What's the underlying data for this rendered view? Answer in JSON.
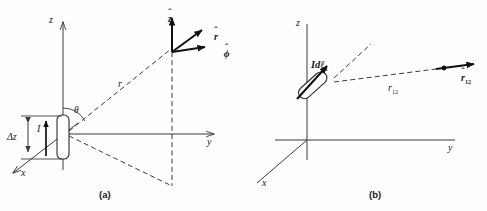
{
  "figure": {
    "background_color": "#fefefe",
    "line_color": "#3b3b3b",
    "bold_line_color": "#111111",
    "text_color": "#1a1a1a",
    "width": 487,
    "height": 211
  },
  "panel_a": {
    "caption": "(a)",
    "axes": {
      "z_label": "z",
      "y_label": "y",
      "x_label": "x"
    },
    "labels": {
      "angle_theta": "θ",
      "radial_distance": "r",
      "current": "I",
      "delta_z": "Δz",
      "unit_z": "z",
      "unit_z_hat": "ˆ",
      "unit_r": "r",
      "unit_r_hat": "ˆ",
      "unit_phi": "ϕ",
      "unit_phi_hat": "ˆ"
    },
    "elements": {
      "dipole_element": "dipole-rod",
      "current_arrow": "current-direction-arrow",
      "delta_z_dimension": "delta-z-dimension",
      "field_point": "field-point",
      "projection": "dashed-projection-triangle"
    }
  },
  "panel_b": {
    "caption": "(b)",
    "axes": {
      "z_label": "z",
      "y_label": "y",
      "x_label": "x"
    },
    "labels": {
      "current_element": "Idℓ",
      "current_element_sub": "1",
      "separation": "r",
      "separation_sub": "12",
      "unit_vector": "r",
      "unit_vector_hat": "ˆ",
      "unit_vector_sub": "12"
    },
    "elements": {
      "current_element_rod": "tilted-current-element",
      "current_element_arrow": "current-element-arrow",
      "separation_line": "dashed-separation-line",
      "source_point": "source-point",
      "field_point": "field-point"
    }
  }
}
